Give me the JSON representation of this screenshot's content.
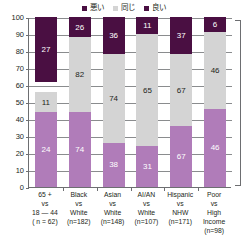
{
  "chart_data": {
    "type": "bar",
    "subtype": "stacked-bar",
    "title": "",
    "xlabel": "",
    "ylabel": "",
    "ylim": [
      0,
      100
    ],
    "yticks": [
      0,
      10,
      20,
      30,
      40,
      50,
      60,
      70,
      80,
      90,
      100
    ],
    "grid": true,
    "legend_position": "top-center",
    "legend": [
      "悪い",
      "同じ",
      "良い"
    ],
    "colors": {
      "bad": "#4a0f42",
      "same": "#d4d4d4",
      "good": "#b07cb9",
      "axis": "#6d6e71",
      "text": "#231f20"
    },
    "categories": [
      "65 + vs 18 — 44 (n = 62)",
      "Black vs White (n=182)",
      "Asian vs White (n=148)",
      "AI/AN vs White (n=107)",
      "Hispanic vs NHW (n=171)",
      "Poor vs High Income (n=98)"
    ],
    "series": [
      {
        "name": "良い",
        "key": "good",
        "values": [
          24,
          74,
          38,
          31,
          67,
          46
        ]
      },
      {
        "name": "同じ",
        "key": "same",
        "values": [
          11,
          82,
          74,
          65,
          67,
          46
        ]
      },
      {
        "name": "悪い",
        "key": "bad",
        "values": [
          27,
          26,
          36,
          11,
          37,
          6
        ]
      }
    ],
    "bars": [
      {
        "category_lines": [
          "65 +",
          "vs",
          "18 — 44",
          "( n = 62)"
        ],
        "segments": [
          {
            "key": "good",
            "label": "24",
            "y0": 0,
            "y1": 44,
            "label_inside": true
          },
          {
            "key": "same",
            "label": "11",
            "y0": 44,
            "y1": 56,
            "label_inside": true
          },
          {
            "key": "bad",
            "label": "27",
            "y0": 62,
            "y1": 100,
            "label_inside": true
          }
        ]
      },
      {
        "category_lines": [
          "Black",
          "vs",
          "White",
          "(n=182)"
        ],
        "segments": [
          {
            "key": "good",
            "label": "74",
            "y0": 0,
            "y1": 44,
            "label_inside": true
          },
          {
            "key": "same",
            "label": "82",
            "y0": 44,
            "y1": 88,
            "label_inside": true
          },
          {
            "key": "bad",
            "label": "26",
            "y0": 88,
            "y1": 100,
            "label_inside": true
          }
        ]
      },
      {
        "category_lines": [
          "Asian",
          "vs",
          "White",
          "(n=148)"
        ],
        "segments": [
          {
            "key": "good",
            "label": "38",
            "y0": 0,
            "y1": 26,
            "label_inside": true
          },
          {
            "key": "same",
            "label": "74",
            "y0": 26,
            "y1": 78,
            "label_inside": true
          },
          {
            "key": "bad",
            "label": "36",
            "y0": 78,
            "y1": 100,
            "label_inside": true
          }
        ]
      },
      {
        "category_lines": [
          "AI/AN",
          "vs",
          "White",
          "(n=107)"
        ],
        "segments": [
          {
            "key": "good",
            "label": "31",
            "y0": 0,
            "y1": 24,
            "label_inside": true
          },
          {
            "key": "same",
            "label": "65",
            "y0": 24,
            "y1": 90,
            "label_inside": true
          },
          {
            "key": "bad",
            "label": "11",
            "y0": 90,
            "y1": 100,
            "label_inside": true
          }
        ]
      },
      {
        "category_lines": [
          "Hispanic",
          "vs",
          "NHW",
          "(n=171)"
        ],
        "segments": [
          {
            "key": "good",
            "label": "67",
            "y0": 0,
            "y1": 36,
            "label_inside": true
          },
          {
            "key": "same",
            "label": "67",
            "y0": 36,
            "y1": 78,
            "label_inside": true
          },
          {
            "key": "bad",
            "label": "37",
            "y0": 78,
            "y1": 100,
            "label_inside": true
          }
        ]
      },
      {
        "category_lines": [
          "Poor",
          "vs",
          "High",
          "Income",
          "(n=98)"
        ],
        "segments": [
          {
            "key": "good",
            "label": "46",
            "y0": 0,
            "y1": 46,
            "label_inside": true
          },
          {
            "key": "same",
            "label": "46",
            "y0": 46,
            "y1": 91,
            "label_inside": true
          },
          {
            "key": "bad",
            "label": "6",
            "y0": 91,
            "y1": 100,
            "label_inside": true
          }
        ]
      }
    ]
  }
}
